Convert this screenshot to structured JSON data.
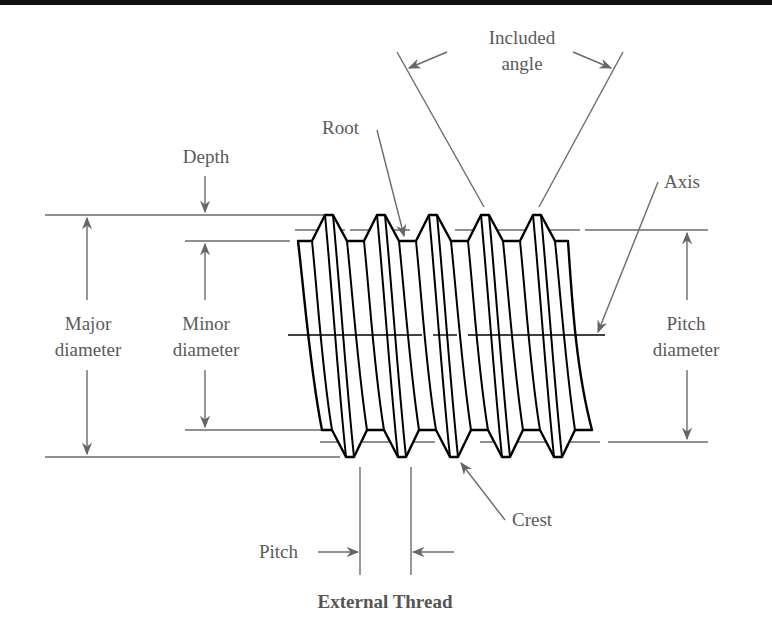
{
  "figure": {
    "caption": "External Thread",
    "labels": {
      "included_angle_line1": "Included",
      "included_angle_line2": "angle",
      "root": "Root",
      "depth": "Depth",
      "axis": "Axis",
      "major_diameter_line1": "Major",
      "major_diameter_line2": "diameter",
      "minor_diameter_line1": "Minor",
      "minor_diameter_line2": "diameter",
      "pitch_diameter_line1": "Pitch",
      "pitch_diameter_line2": "diameter",
      "crest": "Crest",
      "pitch": "Pitch"
    },
    "colors": {
      "label_text": "#5a5a5a",
      "dimension_lines": "#6a6a6a",
      "thread_outline": "#000000",
      "background": "#ffffff"
    },
    "thread_count": 5
  }
}
